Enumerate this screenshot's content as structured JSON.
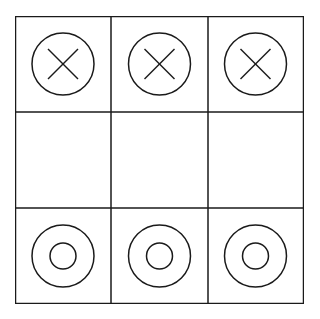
{
  "game": {
    "type": "tic-tac-toe",
    "board": [
      [
        "X",
        "X",
        "X"
      ],
      [
        "",
        "",
        ""
      ],
      [
        "O",
        "O",
        "O"
      ]
    ],
    "colors": {
      "line": "#1a1a1a",
      "background": "#ffffff"
    }
  }
}
